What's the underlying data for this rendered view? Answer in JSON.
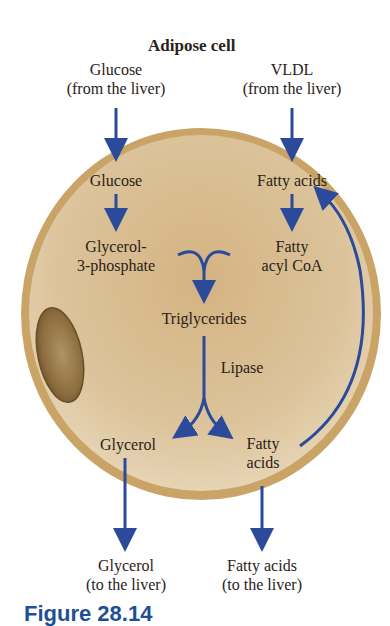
{
  "title": "Adipose cell",
  "inputs": {
    "glucose": {
      "name": "Glucose",
      "source": "(from the liver)"
    },
    "vldl": {
      "name": "VLDL",
      "source": "(from the liver)"
    }
  },
  "cell": {
    "glucose": "Glucose",
    "glycerol3p_line1": "Glycerol-",
    "glycerol3p_line2": "3-phosphate",
    "fatty_acids": "Fatty acids",
    "fatty_acyl_line1": "Fatty",
    "fatty_acyl_line2": "acyl CoA",
    "triglycerides": "Triglycerides",
    "lipase": "Lipase",
    "glycerol": "Glycerol",
    "fatty_acids2_line1": "Fatty",
    "fatty_acids2_line2": "acids"
  },
  "outputs": {
    "glycerol": {
      "name": "Glycerol",
      "dest": "(to the liver)"
    },
    "fatty_acids": {
      "name": "Fatty acids",
      "dest": "(to the liver)"
    }
  },
  "caption": "Figure 28.14",
  "colors": {
    "arrow": "#2b4a9a",
    "membrane": "#c9a466",
    "cytoplasm": "#d9bf95",
    "nucleus": "#8a6b3c",
    "caption": "#1d4f96"
  }
}
